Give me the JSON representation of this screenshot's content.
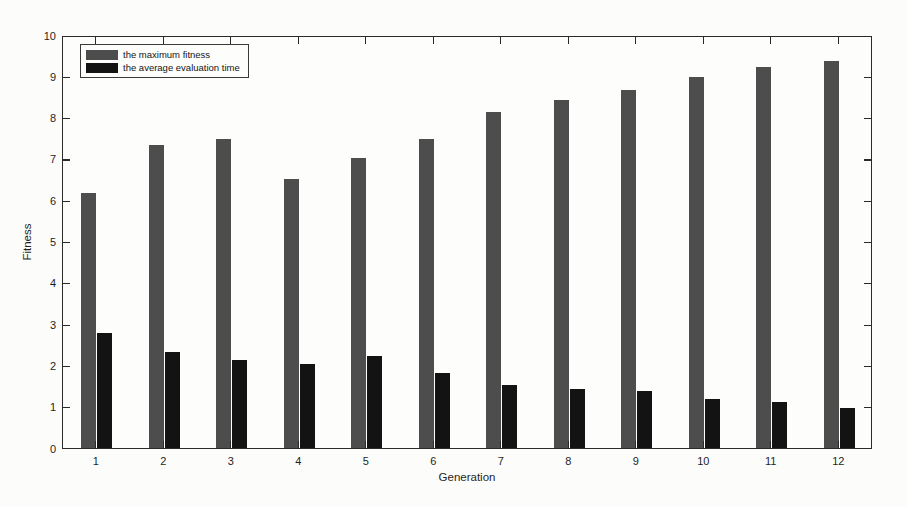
{
  "figure": {
    "background": "#fcfcfa",
    "frame_color": "#2a2a2a",
    "tick_color": "#2a2a2a",
    "text_color": "#1f1f1f"
  },
  "chart_data": {
    "type": "bar",
    "title": "",
    "xlabel": "Generation",
    "ylabel": "Fitness",
    "categories": [
      "1",
      "2",
      "3",
      "4",
      "5",
      "6",
      "7",
      "8",
      "9",
      "10",
      "11",
      "12"
    ],
    "series": [
      {
        "name": "the maximum fitness",
        "color": "#4d4d4d",
        "values": [
          6.2,
          7.35,
          7.5,
          6.55,
          7.05,
          7.5,
          8.15,
          8.45,
          8.7,
          9.0,
          9.25,
          9.4
        ]
      },
      {
        "name": "the average evaluation time",
        "color": "#131313",
        "values": [
          2.8,
          2.35,
          2.15,
          2.05,
          2.25,
          1.85,
          1.55,
          1.45,
          1.4,
          1.2,
          1.15,
          1.0
        ]
      }
    ],
    "ylim": [
      0,
      10
    ],
    "yticks": [
      0,
      1,
      2,
      3,
      4,
      5,
      6,
      7,
      8,
      9,
      10
    ],
    "grid": false,
    "legend_position": "top-left"
  }
}
